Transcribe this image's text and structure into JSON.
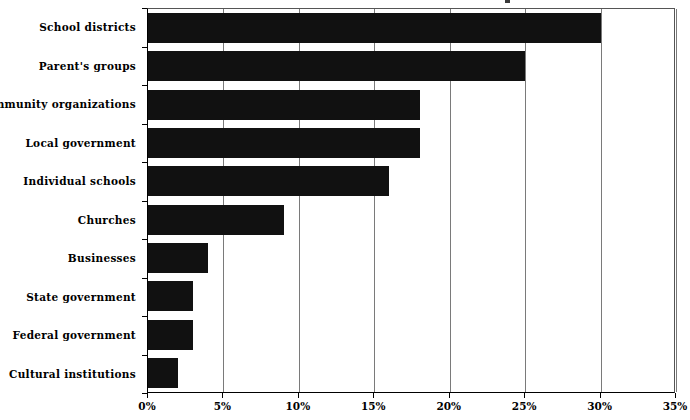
{
  "chart_data": {
    "type": "bar",
    "orientation": "horizontal",
    "title": "",
    "xlabel": "",
    "ylabel": "",
    "categories": [
      "School districts",
      "Parent's groups",
      "Community organizations",
      "Local government",
      "Individual schools",
      "Churches",
      "Businesses",
      "State government",
      "Federal government",
      "Cultural institutions"
    ],
    "values": [
      30,
      25,
      18,
      18,
      16,
      9,
      4,
      3,
      3,
      2
    ],
    "value_unit": "%",
    "xlim": [
      0,
      35
    ],
    "xticks": [
      0,
      5,
      10,
      15,
      20,
      25,
      30,
      35
    ],
    "xtick_labels": [
      "0%",
      "5%",
      "10%",
      "15%",
      "20%",
      "25%",
      "30%",
      "35%"
    ],
    "grid": true,
    "grid_axis": "x",
    "legend": false,
    "bar_color": "#111111",
    "grid_color": "#7a7a7a",
    "axis_color": "#000000",
    "background_color": "#ffffff"
  }
}
